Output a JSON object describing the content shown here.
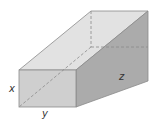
{
  "diagram": {
    "type": "rectangular-prism",
    "labels": {
      "height": "x",
      "width": "y",
      "length": "z"
    },
    "colors": {
      "front_face": "#cfcfcf",
      "top_face": "#e2e2e2",
      "right_face": "#a9a9a9",
      "edge": "#8a8a8a",
      "hidden_edge": "#8a8a8a"
    }
  }
}
